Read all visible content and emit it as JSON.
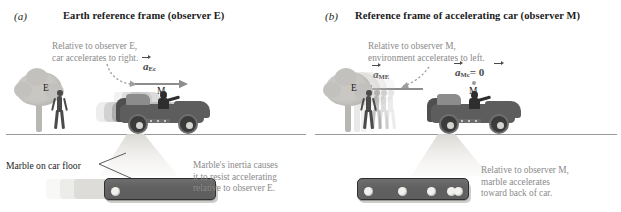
{
  "figure": {
    "type": "physics-textbook-figure"
  },
  "panels": [
    {
      "letter": "(a)",
      "title": "Earth reference frame (observer E)",
      "top_note": "Relative to observer E,\ncar accelerates to right.",
      "vector_label": {
        "symbol": "a",
        "subscript": "Ec",
        "arrow": true,
        "equals": ""
      },
      "observer_label": "E",
      "car_observer_label": "M",
      "callout_label": "Marble on car floor",
      "bottom_note": "Marble's inertia causes\nit to resist accelerating\nrelative to observer E.",
      "accel_direction": "right",
      "marble_count": 1
    },
    {
      "letter": "(b)",
      "title": "Reference frame of accelerating car (observer M)",
      "top_note": "Relative to observer M,\nenvironment accelerates to left.",
      "vector_label": {
        "symbol": "a",
        "subscript": "ME",
        "arrow": true,
        "equals": ""
      },
      "vector_label_2": {
        "symbol": "a",
        "subscript": "Mc",
        "arrow": true,
        "equals": "= 0"
      },
      "observer_label": "E",
      "car_observer_label": "M",
      "callout_label": "",
      "bottom_note": "Relative to observer M,\nmarble accelerates\ntoward back of car.",
      "accel_direction": "left",
      "marble_count": 4
    }
  ],
  "colors": {
    "note_text": "#8a8a8a",
    "title_text": "#1a1a1a",
    "arrow": "#8d8d8d",
    "car_body": "#5d5d5d",
    "tree": "#c9c7c3",
    "marble": "#f3f1ed",
    "marble_box": "#5f5f5f",
    "ground_line": "#9a9a9a"
  }
}
